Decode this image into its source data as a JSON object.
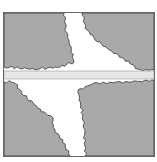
{
  "figure": {
    "colors": {
      "block_fill": "#a9a9a9",
      "edge_stroke": "#222222",
      "gap_fill": "#ffffff",
      "band_fill": "#e6e6e6",
      "band_stroke": "#9a9a9a",
      "frame_stroke": "#555555"
    },
    "regions": [
      {
        "name": "top-left-block"
      },
      {
        "name": "top-right-block"
      },
      {
        "name": "bottom-left-block"
      },
      {
        "name": "bottom-right-block"
      },
      {
        "name": "horizontal-band"
      }
    ]
  },
  "caption": {
    "text": ""
  }
}
